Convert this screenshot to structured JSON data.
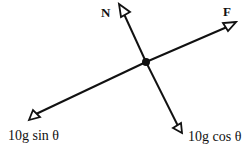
{
  "diagram": {
    "center": {
      "x": 146,
      "y": 62
    },
    "colors": {
      "line": "#111111",
      "background": "#ffffff"
    },
    "forces": [
      {
        "id": "N",
        "label": "N",
        "bold": true
      },
      {
        "id": "F",
        "label": "F",
        "bold": true
      },
      {
        "id": "sin",
        "label": "10g sin θ",
        "bold": false
      },
      {
        "id": "cos",
        "label": "10g cos θ",
        "bold": false
      }
    ]
  }
}
